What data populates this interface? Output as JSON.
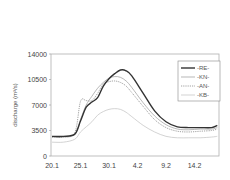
{
  "chart_data": {
    "type": "line",
    "title": "",
    "xlabel": "",
    "ylabel": "discharge (m3/s)",
    "ylabel_display": "discharge (m³/s)",
    "ylim": [
      0,
      14000
    ],
    "yticks": [
      0,
      3500,
      7000,
      10500,
      14000
    ],
    "xticks": [
      "20.1",
      "25.1",
      "30.1",
      "4.2",
      "9.2",
      "14.2"
    ],
    "grid": false,
    "legend_position": "upper right",
    "x_days_from_20_1": [
      0,
      2,
      4,
      5,
      6,
      7,
      8,
      9,
      10,
      11,
      12,
      13,
      14,
      16,
      18,
      20,
      22,
      24,
      26,
      28,
      29
    ],
    "series": [
      {
        "name": "-RE-",
        "style": "solid-thick",
        "color": "#333333",
        "values": [
          2700,
          2700,
          3000,
          4800,
          6700,
          7400,
          8000,
          9600,
          10600,
          11300,
          11800,
          11700,
          11000,
          8600,
          6200,
          4700,
          4000,
          3900,
          3900,
          3900,
          4200
        ]
      },
      {
        "name": "-KN-",
        "style": "solid-thin",
        "color": "#9a9a9a",
        "values": [
          2600,
          2600,
          3000,
          5000,
          7000,
          8200,
          9300,
          10100,
          10700,
          10900,
          10800,
          10300,
          9400,
          7300,
          5500,
          4300,
          3700,
          3600,
          3700,
          3700,
          3900
        ]
      },
      {
        "name": "-AN-",
        "style": "dotted",
        "color": "#8a8a8a",
        "values": [
          2600,
          2600,
          3200,
          7500,
          7600,
          7600,
          8600,
          9900,
          10200,
          10300,
          10100,
          9600,
          8700,
          6800,
          5000,
          3900,
          3400,
          3300,
          3400,
          3500,
          3700
        ]
      },
      {
        "name": "-KB-",
        "style": "solid-light",
        "color": "#c8c8c8",
        "values": [
          1900,
          1900,
          2300,
          3300,
          4000,
          4700,
          5600,
          6100,
          6400,
          6500,
          6400,
          6000,
          5400,
          4200,
          3300,
          2700,
          2500,
          2500,
          2500,
          2600,
          2700
        ]
      }
    ]
  }
}
